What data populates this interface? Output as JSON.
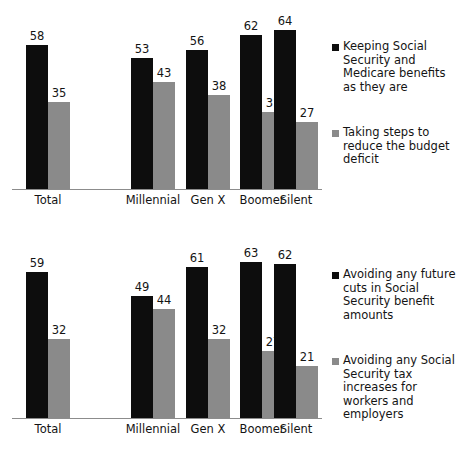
{
  "chart_data": [
    {
      "type": "bar",
      "title": "",
      "xlabel": "",
      "ylabel": "",
      "ylim": [
        0,
        64
      ],
      "grid": false,
      "legend_position": "right",
      "categories": [
        "Total",
        "Millennial",
        "Gen X",
        "Boomer",
        "Silent"
      ],
      "series": [
        {
          "name": "Keeping Social Security and Medicare benefits as they are",
          "color": "#0d0d0d",
          "values": [
            58,
            53,
            56,
            62,
            64
          ]
        },
        {
          "name": "Taking steps to reduce the budget deficit",
          "color": "#8a8a8a",
          "values": [
            35,
            43,
            38,
            31,
            27
          ]
        }
      ]
    },
    {
      "type": "bar",
      "title": "",
      "xlabel": "",
      "ylabel": "",
      "ylim": [
        0,
        63
      ],
      "grid": false,
      "legend_position": "right",
      "categories": [
        "Total",
        "Millennial",
        "Gen X",
        "Boomer",
        "Silent"
      ],
      "series": [
        {
          "name": "Avoiding any future cuts in Social Security benefit amounts",
          "color": "#0d0d0d",
          "values": [
            59,
            49,
            61,
            63,
            62
          ]
        },
        {
          "name": "Avoiding any Social Security tax increases for workers and employers",
          "color": "#8a8a8a",
          "values": [
            32,
            44,
            32,
            27,
            21
          ]
        }
      ]
    }
  ],
  "charts": [
    {
      "id": "top",
      "legend": [
        {
          "label": "Keeping Social Security and Medicare benefits as they are",
          "color": "#0d0d0d"
        },
        {
          "label": "Taking steps to reduce the budget deficit",
          "color": "#8a8a8a"
        }
      ],
      "categories": [
        {
          "label": "Total",
          "x": 26,
          "v0": 58,
          "v1": 35
        },
        {
          "label": "Millennial",
          "x": 131,
          "v0": 53,
          "v1": 43
        },
        {
          "label": "Gen X",
          "x": 186,
          "v0": 56,
          "v1": 38
        },
        {
          "label": "Boomer",
          "x": 240,
          "v0": 62,
          "v1": 31
        },
        {
          "label": "Silent",
          "x": 274,
          "v0": 64,
          "v1": 27
        }
      ]
    },
    {
      "id": "bottom",
      "legend": [
        {
          "label": "Avoiding any future cuts in Social Security benefit amounts",
          "color": "#0d0d0d"
        },
        {
          "label": "Avoiding any Social Security tax increases for workers and employers",
          "color": "#8a8a8a"
        }
      ],
      "categories": [
        {
          "label": "Total",
          "x": 26,
          "v0": 59,
          "v1": 32
        },
        {
          "label": "Millennial",
          "x": 131,
          "v0": 49,
          "v1": 44
        },
        {
          "label": "Gen X",
          "x": 186,
          "v0": 61,
          "v1": 32
        },
        {
          "label": "Boomer",
          "x": 240,
          "v0": 63,
          "v1": 27
        },
        {
          "label": "Silent",
          "x": 274,
          "v0": 62,
          "v1": 21
        }
      ]
    }
  ],
  "scale": {
    "px_per_unit": 2.48,
    "bar_width": 22
  }
}
